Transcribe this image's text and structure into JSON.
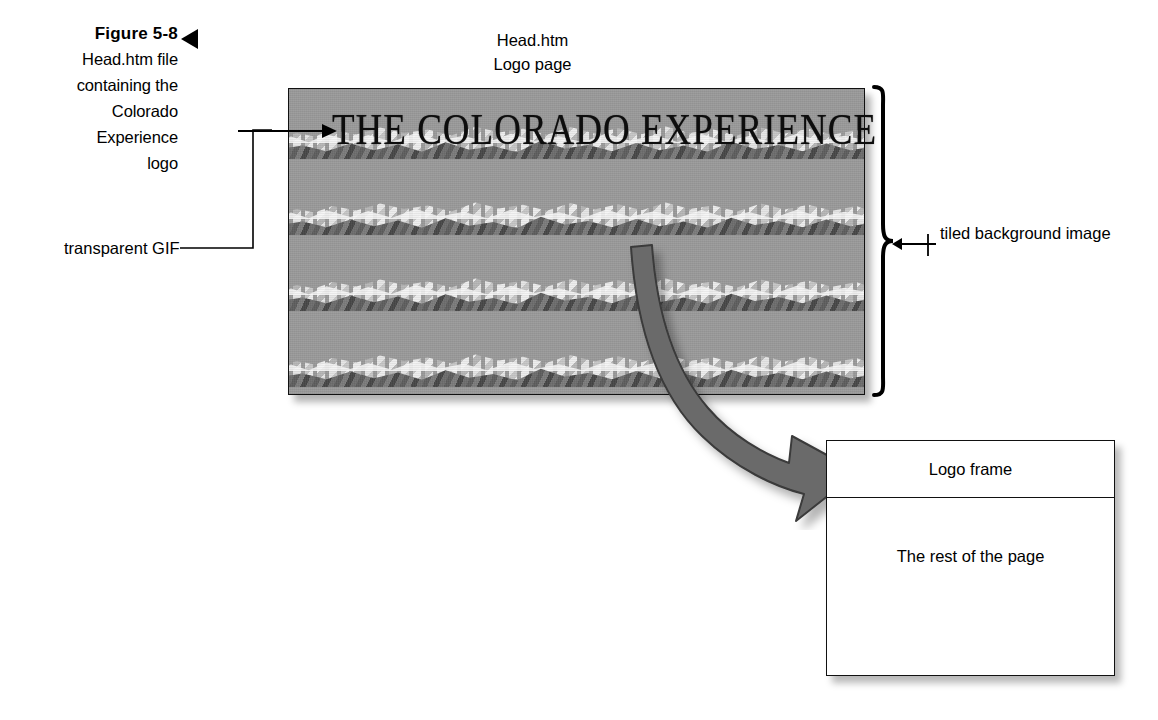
{
  "figure": {
    "number": "Figure 5-8",
    "caption_lines": [
      "Head.htm file",
      "containing the",
      "Colorado",
      "Experience",
      "logo"
    ]
  },
  "annotations": {
    "transparent_gif": "transparent GIF",
    "tiled_background": "tiled background image"
  },
  "page_labels": {
    "file_name": "Head.htm",
    "page_name": "Logo page"
  },
  "logo": {
    "text": "THE COLORADO EXPERIENCE"
  },
  "frame_diagram": {
    "logo_frame_label": "Logo frame",
    "rest_of_page_label": "The rest of the page"
  },
  "colors": {
    "page_background": "#ffffff",
    "ink": "#000000",
    "image_background_gray": "#9a9a9a",
    "arrow_gray": "#6b6b6b",
    "arrow_outline": "#3a3a3a",
    "box_border": "#111111"
  }
}
